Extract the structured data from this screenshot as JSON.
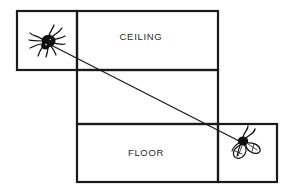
{
  "figure": {
    "background_color": "#ffffff",
    "line_color": "#1a1a1a",
    "width": 291,
    "height": 196
  },
  "panels": [
    {
      "id": "spider-panel",
      "label": "",
      "x": 17,
      "y": 11,
      "width": 60,
      "height": 59
    },
    {
      "id": "ceiling-panel",
      "label": "CEILING",
      "label_x": 141,
      "label_y": 37,
      "x": 77,
      "y": 11,
      "width": 141,
      "height": 59
    },
    {
      "id": "wall-panel",
      "label": "",
      "x": 77,
      "y": 70,
      "width": 141,
      "height": 54
    },
    {
      "id": "floor-panel",
      "label": "FLOOR",
      "label_x": 146,
      "label_y": 153,
      "x": 77,
      "y": 124,
      "width": 141,
      "height": 58
    },
    {
      "id": "fly-panel",
      "label": "",
      "x": 218,
      "y": 124,
      "width": 59,
      "height": 58
    }
  ],
  "path": {
    "name": "shortest-path-line",
    "start_x": 47,
    "start_y": 43,
    "end_x": 243,
    "end_y": 143,
    "description": "straight line from spider to fly across unfolded surfaces"
  },
  "creatures": [
    {
      "id": "spider",
      "icon": "spider-icon",
      "center_x": 47,
      "center_y": 42,
      "color": "#111111"
    },
    {
      "id": "fly",
      "icon": "fly-icon",
      "center_x": 243,
      "center_y": 142,
      "color": "#111111"
    }
  ]
}
